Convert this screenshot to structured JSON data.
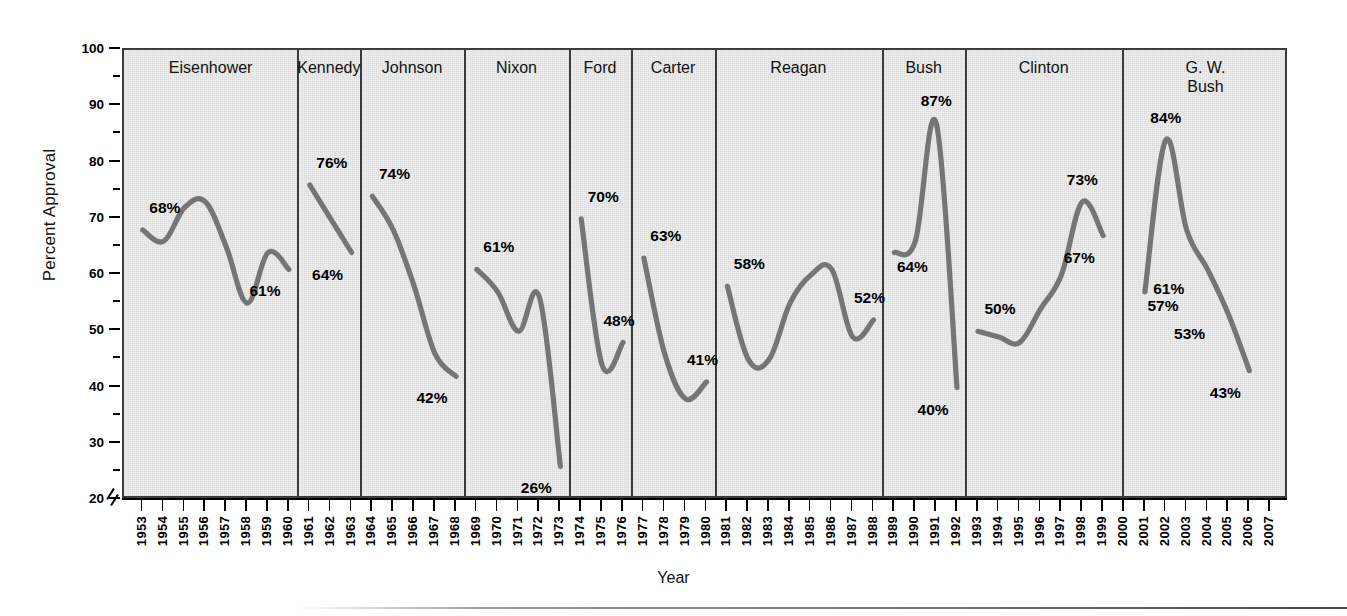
{
  "chart_data": {
    "type": "line",
    "title": "",
    "xlabel": "Year",
    "ylabel": "Percent Approval",
    "ylim": [
      20,
      100
    ],
    "ytick_labels": [
      "100",
      "90",
      "80",
      "70",
      "60",
      "50",
      "40",
      "30",
      "20"
    ],
    "ytick_values": [
      100,
      90,
      80,
      70,
      60,
      50,
      40,
      30,
      20
    ],
    "yminor_step": 5,
    "axis_break": true,
    "grid": false,
    "legend": "none",
    "xlim": [
      1953,
      2007
    ],
    "x_tick_labels": [
      "1953",
      "1954",
      "1955",
      "1956",
      "1957",
      "1958",
      "1959",
      "1960",
      "1961",
      "1962",
      "1963",
      "1964",
      "1965",
      "1966",
      "1967",
      "1968",
      "1969",
      "1970",
      "1971",
      "1972",
      "1973",
      "1974",
      "1975",
      "1976",
      "1977",
      "1978",
      "1979",
      "1980",
      "1981",
      "1982",
      "1983",
      "1984",
      "1985",
      "1986",
      "1987",
      "1988",
      "1989",
      "1990",
      "1991",
      "1992",
      "1993",
      "1994",
      "1995",
      "1996",
      "1997",
      "1998",
      "1999",
      "2000",
      "2001",
      "2002",
      "2003",
      "2004",
      "2005",
      "2006",
      "2007"
    ],
    "series": [
      {
        "name": "Eisenhower",
        "panel_label": "Eisenhower",
        "x": [
          1953,
          1954,
          1955,
          1956,
          1957,
          1958,
          1959,
          1960
        ],
        "values": [
          68,
          66,
          72,
          73,
          65,
          55,
          64,
          61
        ],
        "annotations": [
          {
            "text": "68%",
            "year": 1953,
            "value": 68
          },
          {
            "text": "61%",
            "year": 1960,
            "value": 61
          }
        ]
      },
      {
        "name": "Kennedy",
        "panel_label": "Kennedy",
        "x": [
          1961,
          1962,
          1963
        ],
        "values": [
          76,
          70,
          64
        ],
        "annotations": [
          {
            "text": "76%",
            "year": 1961,
            "value": 76
          },
          {
            "text": "64%",
            "year": 1963,
            "value": 64
          }
        ]
      },
      {
        "name": "Johnson",
        "panel_label": "Johnson",
        "x": [
          1964,
          1965,
          1966,
          1967,
          1968
        ],
        "values": [
          74,
          68,
          58,
          46,
          42
        ],
        "annotations": [
          {
            "text": "74%",
            "year": 1964,
            "value": 74
          },
          {
            "text": "42%",
            "year": 1968,
            "value": 42
          }
        ]
      },
      {
        "name": "Nixon",
        "panel_label": "Nixon",
        "x": [
          1969,
          1970,
          1971,
          1972,
          1973
        ],
        "values": [
          61,
          57,
          50,
          56,
          26
        ],
        "annotations": [
          {
            "text": "61%",
            "year": 1969,
            "value": 61
          },
          {
            "text": "26%",
            "year": 1973,
            "value": 26
          }
        ]
      },
      {
        "name": "Ford",
        "panel_label": "Ford",
        "x": [
          1974,
          1975,
          1976
        ],
        "values": [
          70,
          44,
          48
        ],
        "annotations": [
          {
            "text": "70%",
            "year": 1974,
            "value": 70
          },
          {
            "text": "48%",
            "year": 1976,
            "value": 48
          }
        ]
      },
      {
        "name": "Carter",
        "panel_label": "Carter",
        "x": [
          1977,
          1978,
          1979,
          1980
        ],
        "values": [
          63,
          46,
          38,
          41
        ],
        "annotations": [
          {
            "text": "63%",
            "year": 1977,
            "value": 63
          },
          {
            "text": "41%",
            "year": 1980,
            "value": 41
          }
        ]
      },
      {
        "name": "Reagan",
        "panel_label": "Reagan",
        "x": [
          1981,
          1982,
          1983,
          1984,
          1985,
          1986,
          1987,
          1988
        ],
        "values": [
          58,
          45,
          45,
          55,
          60,
          61,
          49,
          52
        ],
        "annotations": [
          {
            "text": "58%",
            "year": 1981,
            "value": 58
          },
          {
            "text": "52%",
            "year": 1988,
            "value": 52
          }
        ]
      },
      {
        "name": "Bush",
        "panel_label": "Bush",
        "x": [
          1989,
          1990,
          1991,
          1992
        ],
        "values": [
          64,
          66,
          87,
          40
        ],
        "annotations": [
          {
            "text": "64%",
            "year": 1989,
            "value": 64
          },
          {
            "text": "87%",
            "year": 1991,
            "value": 87
          },
          {
            "text": "40%",
            "year": 1992,
            "value": 40
          }
        ]
      },
      {
        "name": "Clinton",
        "panel_label": "Clinton",
        "x": [
          1993,
          1994,
          1995,
          1996,
          1997,
          1998,
          1999
        ],
        "values": [
          50,
          49,
          48,
          54,
          60,
          73,
          67
        ],
        "annotations": [
          {
            "text": "50%",
            "year": 1993,
            "value": 50
          },
          {
            "text": "73%",
            "year": 1998,
            "value": 73
          },
          {
            "text": "67%",
            "year": 1999,
            "value": 67
          }
        ]
      },
      {
        "name": "G. W. Bush",
        "panel_label": "G. W.\nBush",
        "x": [
          2001,
          2002,
          2003,
          2004,
          2005,
          2006
        ],
        "values": [
          57,
          84,
          68,
          61,
          53,
          43
        ],
        "annotations": [
          {
            "text": "84%",
            "year": 2002,
            "value": 84
          },
          {
            "text": "57%",
            "year": 2001,
            "value": 57
          },
          {
            "text": "61%",
            "year": 2003,
            "value": 61
          },
          {
            "text": "53%",
            "year": 2004,
            "value": 53
          },
          {
            "text": "43%",
            "year": 2006,
            "value": 43
          }
        ]
      }
    ],
    "colors": {
      "line": "#6f6f6f",
      "panel_background": "#eeeeee",
      "frame": "#3b3b3b",
      "text": "#111111"
    }
  }
}
